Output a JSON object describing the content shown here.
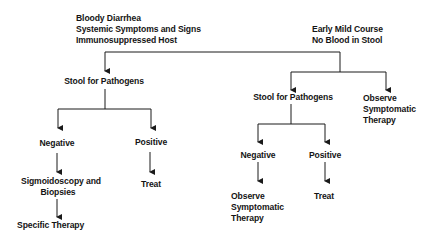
{
  "diagram": {
    "type": "flowchart",
    "colors": {
      "line": "#1a1a1a",
      "text": "#141414",
      "background": "#ffffff"
    },
    "left_branch": {
      "condition": {
        "line1": "Bloody Diarrhea",
        "line2": "Systemic Symptoms and Signs",
        "line3": "Immunosuppressed Host"
      },
      "test": "Stool for Pathogens",
      "negative": {
        "label": "Negative",
        "next_line1": "Sigmoidoscopy and",
        "next_line2": "Biopsies",
        "final": "Specific Therapy"
      },
      "positive": {
        "label": "Positive",
        "next": "Treat"
      }
    },
    "right_branch": {
      "condition": {
        "line1": "Early Mild Course",
        "line2": "No Blood in Stool"
      },
      "test": "Stool for Pathogens",
      "observe": {
        "line1": "Observe",
        "line2": "Symptomatic",
        "line3": "Therapy"
      },
      "negative": {
        "label": "Negative",
        "next_line1": "Observe",
        "next_line2": "Symptomatic",
        "next_line3": "Therapy"
      },
      "positive": {
        "label": "Positive",
        "next": "Treat"
      }
    }
  }
}
